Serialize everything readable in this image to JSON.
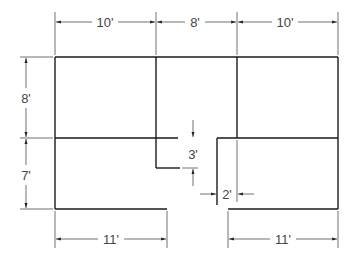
{
  "diagram": {
    "type": "floor-plan",
    "units": "feet",
    "top_dimensions": [
      {
        "label": "10'",
        "value": 10
      },
      {
        "label": "8'",
        "value": 8
      },
      {
        "label": "10'",
        "value": 10
      }
    ],
    "left_dimensions": [
      {
        "label": "8'",
        "value": 8
      },
      {
        "label": "7'",
        "value": 7
      }
    ],
    "bottom_dimensions": [
      {
        "label": "11'",
        "value": 11
      },
      {
        "label": "11'",
        "value": 11
      }
    ],
    "notch_dimensions": {
      "height": {
        "label": "3'",
        "value": 3
      },
      "width": {
        "label": "2'",
        "value": 2
      }
    },
    "colors": {
      "wall": "#1a1a1a",
      "dimension": "#333333",
      "text": "#444444",
      "background": "#ffffff"
    }
  }
}
